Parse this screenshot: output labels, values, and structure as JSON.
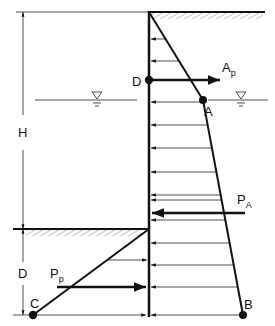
{
  "diagram": {
    "colors": {
      "ink": "#111111",
      "thin": "#222222",
      "hatch": "#8a8a8a"
    },
    "labels": {
      "H": "H",
      "D": "D",
      "point_D": "D",
      "point_A": "A",
      "point_B": "B",
      "point_C": "C",
      "Ap_main": "A",
      "Ap_sub": "p",
      "PA_main": "P",
      "PA_sub": "A",
      "Pp_main": "P",
      "Pp_sub": "p"
    },
    "symbols": {
      "water_level": "water-level-triangle"
    },
    "pressure_arrow_count_active": 14,
    "pressure_arrow_count_passive": 5
  }
}
